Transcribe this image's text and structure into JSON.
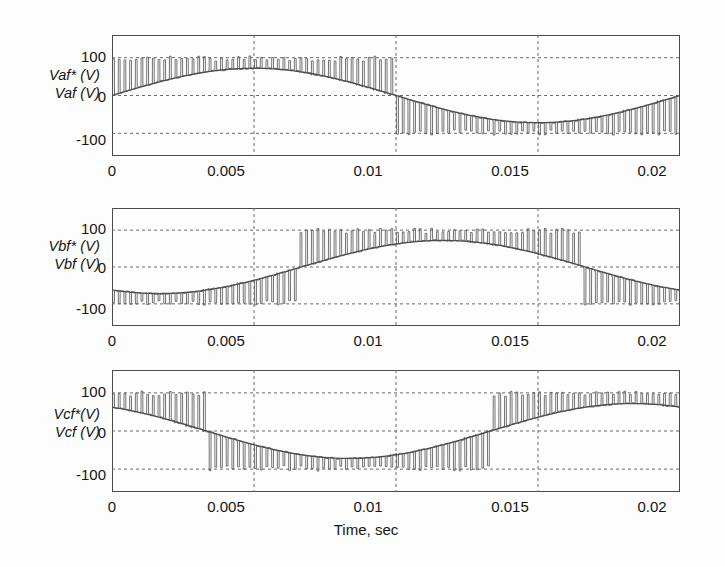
{
  "figure": {
    "title": "",
    "background": "#fdfdfd",
    "axis_color": "#4a4a4a",
    "grid_color": "#6b6b6b",
    "trace_color": "#5a5a5a",
    "xlabel": "Time, sec"
  },
  "axis": {
    "xticks": [
      "0",
      "0.005",
      "0.01",
      "0.015",
      "0.02"
    ],
    "xtick_values": [
      0,
      0.005,
      0.01,
      0.015,
      0.02
    ],
    "yticks": [
      "100",
      "0",
      "-100"
    ],
    "ytick_values": [
      100,
      0,
      -100
    ],
    "xlim": [
      0,
      0.02
    ],
    "ylim": [
      -160,
      160
    ]
  },
  "subplots": [
    {
      "id": "subplot-a",
      "ylabel_line1": "Vaf* (V)",
      "ylabel_line2": "Vaf  (V)",
      "phase_deg": 0,
      "yticks": [
        "100",
        "0",
        "-100"
      ],
      "xticks": [
        "0",
        "0.005",
        "0.01",
        "0.015",
        "0.02"
      ]
    },
    {
      "id": "subplot-b",
      "ylabel_line1": "Vbf* (V)",
      "ylabel_line2": "Vbf  (V)",
      "phase_deg": -120,
      "yticks": [
        "100",
        "0",
        "-100"
      ],
      "xticks": [
        "0",
        "0.005",
        "0.01",
        "0.015",
        "0.02"
      ]
    },
    {
      "id": "subplot-c",
      "ylabel_line1": "Vcf*(V)",
      "ylabel_line2": "Vcf  (V)",
      "phase_deg": 120,
      "yticks": [
        "100",
        "0",
        "-100"
      ],
      "xticks": [
        "0",
        "0.005",
        "0.01",
        "0.015",
        "0.02"
      ]
    }
  ],
  "chart_data": {
    "type": "line",
    "title": "",
    "xlabel": "Time, sec",
    "ylabel": "",
    "xlim": [
      0,
      0.02
    ],
    "ylim": [
      -160,
      160
    ],
    "xticks": [
      0,
      0.005,
      0.01,
      0.015,
      0.02
    ],
    "yticks": [
      -100,
      0,
      100
    ],
    "grid": true,
    "legend": null,
    "panels": [
      {
        "name": "Phase A",
        "ylabel_reference": "Vaf* (V)",
        "ylabel_measured": "Vaf  (V)",
        "series": [
          {
            "name": "Vaf  (V)",
            "kind": "reference-sine",
            "amplitude": 72,
            "frequency_hz": 50,
            "phase_deg": 0,
            "description": "smooth filtered sinusoid"
          },
          {
            "name": "Vaf* (V)",
            "kind": "pwm-switched",
            "amplitude": 72,
            "frequency_hz": 50,
            "phase_deg": 0,
            "carrier_hz": 2500,
            "spike_peak": 105,
            "description": "PWM switched waveform with narrow spikes toward +/-100 V riding on the sinusoid"
          }
        ]
      },
      {
        "name": "Phase B",
        "ylabel_reference": "Vbf* (V)",
        "ylabel_measured": "Vbf  (V)",
        "series": [
          {
            "name": "Vbf  (V)",
            "kind": "reference-sine",
            "amplitude": 72,
            "frequency_hz": 50,
            "phase_deg": -120,
            "description": "smooth filtered sinusoid"
          },
          {
            "name": "Vbf* (V)",
            "kind": "pwm-switched",
            "amplitude": 72,
            "frequency_hz": 50,
            "phase_deg": -120,
            "carrier_hz": 2500,
            "spike_peak": 105,
            "description": "PWM switched waveform with narrow spikes toward +/-100 V riding on the sinusoid"
          }
        ]
      },
      {
        "name": "Phase C",
        "ylabel_reference": "Vcf*(V)",
        "ylabel_measured": "Vcf  (V)",
        "series": [
          {
            "name": "Vcf  (V)",
            "kind": "reference-sine",
            "amplitude": 72,
            "frequency_hz": 50,
            "phase_deg": 120,
            "description": "smooth filtered sinusoid"
          },
          {
            "name": "Vcf*(V)",
            "kind": "pwm-switched",
            "amplitude": 72,
            "frequency_hz": 50,
            "phase_deg": 120,
            "carrier_hz": 2500,
            "spike_peak": 105,
            "description": "PWM switched waveform with narrow spikes toward +/-100 V riding on the sinusoid"
          }
        ]
      }
    ]
  }
}
